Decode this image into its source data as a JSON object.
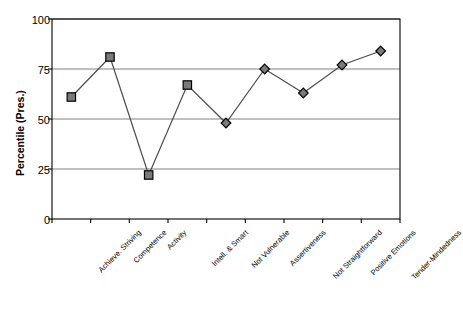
{
  "chart_data": {
    "type": "line",
    "title": "",
    "xlabel": "",
    "ylabel": "Percentile (Pres.)",
    "ylim": [
      0,
      100
    ],
    "yticks": [
      0,
      25,
      50,
      75,
      100
    ],
    "grid": true,
    "legend": "none",
    "categories": [
      "Achieve. Striving",
      "Competence",
      "Activity",
      "Intell. & Smart",
      "Not Vulnerable",
      "Assertiveness",
      "Not Straightforward",
      "Positive Emotions",
      "Tender-Mindedness"
    ],
    "values": [
      61,
      81,
      22,
      67,
      48,
      75,
      63,
      77,
      84
    ],
    "markers": [
      "square",
      "square",
      "square",
      "square",
      "diamond",
      "diamond",
      "diamond",
      "diamond",
      "diamond"
    ],
    "marker_fill": "#7a7a7a",
    "marker_stroke": "#000000",
    "line_color": "#4d4d4d",
    "grid_color": "#808080",
    "axis_color": "#000000"
  },
  "axes": {
    "y_title": "Percentile (Pres.)",
    "y_tick_labels": [
      "100",
      "75",
      "50",
      "25",
      "0"
    ]
  }
}
